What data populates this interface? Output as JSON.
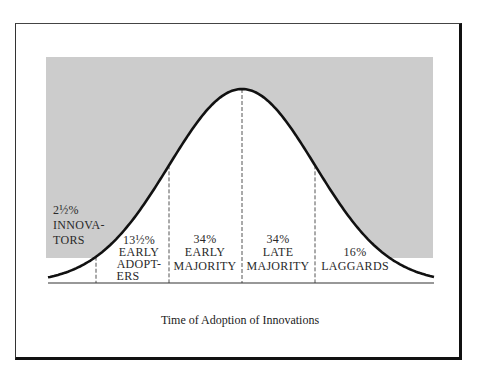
{
  "diagram": {
    "title": "Time of Adoption of Innovations",
    "colors": {
      "shade": "#cccccc",
      "curve": "#111111",
      "divider": "#555555",
      "frame": "#111111"
    },
    "segments": [
      {
        "id": "innovators",
        "percent": "2½%",
        "lines": [
          "INNOVA-",
          "TORS"
        ]
      },
      {
        "id": "early-adopters",
        "percent": "13½%",
        "lines": [
          "EARLY",
          "ADOPT-",
          "ERS"
        ]
      },
      {
        "id": "early-majority",
        "percent": "34%",
        "lines": [
          "EARLY",
          "MAJORITY"
        ]
      },
      {
        "id": "late-majority",
        "percent": "34%",
        "lines": [
          "LATE",
          "MAJORITY"
        ]
      },
      {
        "id": "laggards",
        "percent": "16%",
        "lines": [
          "LAGGARDS"
        ]
      }
    ]
  }
}
